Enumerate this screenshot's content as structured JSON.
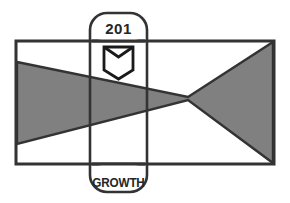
{
  "logo": {
    "name": "growth-201-logo",
    "tab": {
      "number_label": "201",
      "wordmark_label": "GROWTH",
      "emblem_name": "open-book-emblem"
    },
    "colors": {
      "outline": "#333333",
      "fill_gray": "#808080",
      "background": "#ffffff",
      "text": "#262626"
    },
    "shapes": {
      "rectangle_name": "outer-rectangle",
      "bowtie_name": "gray-bowtie-shape",
      "tab_name": "vertical-rounded-tab"
    }
  }
}
